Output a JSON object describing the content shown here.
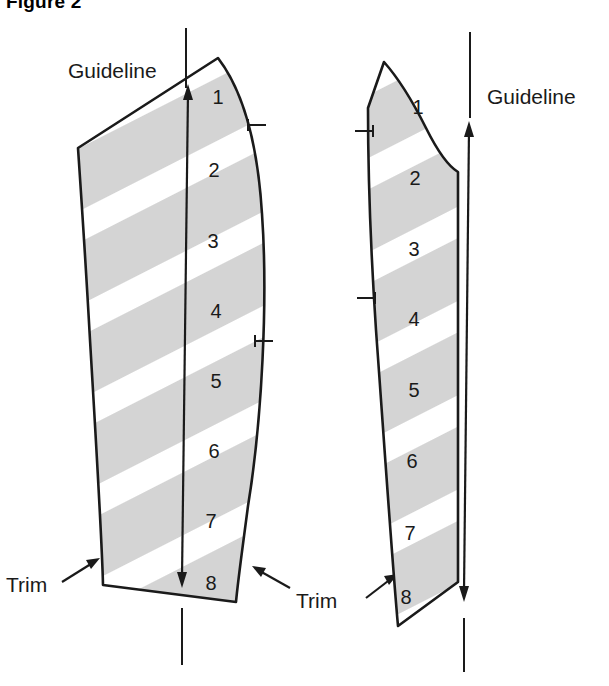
{
  "figure": {
    "title": "Figure 2",
    "type": "sewing-pattern-diagram"
  },
  "colors": {
    "stripe_gray": "#d4d4d4",
    "stripe_white": "#ffffff",
    "outline": "#1a1a1a",
    "text": "#1a1a1a",
    "background": "#ffffff"
  },
  "labels": {
    "guideline_left": "Guideline",
    "guideline_right": "Guideline",
    "trim_left": "Trim",
    "trim_right": "Trim"
  },
  "pieces": [
    {
      "id": "left-piece",
      "name": "Left pattern piece",
      "segments": [
        "1",
        "2",
        "3",
        "4",
        "5",
        "6",
        "7",
        "8"
      ],
      "notch_count": 2,
      "guideline_direction": "double-headed-vertical"
    },
    {
      "id": "right-piece",
      "name": "Right pattern piece",
      "segments": [
        "1",
        "2",
        "3",
        "4",
        "5",
        "6",
        "7",
        "8"
      ],
      "notch_count": 2,
      "guideline_direction": "double-headed-vertical"
    }
  ],
  "segment_numbers": {
    "left": [
      "1",
      "2",
      "3",
      "4",
      "5",
      "6",
      "7",
      "8"
    ],
    "right": [
      "1",
      "2",
      "3",
      "4",
      "5",
      "6",
      "7",
      "8"
    ]
  }
}
